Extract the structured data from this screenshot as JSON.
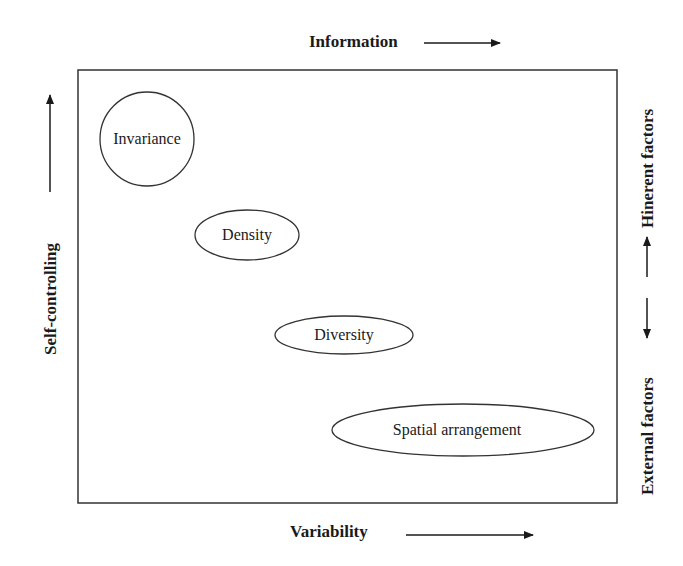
{
  "axes": {
    "top": {
      "label": "Information",
      "arrow": "right"
    },
    "bottom": {
      "label": "Variability",
      "arrow": "right"
    },
    "left": {
      "label": "Self-controlling",
      "arrow": "up"
    },
    "right": {
      "label_top": "Hinerent factors",
      "label_bottom": "External factors",
      "arrows": [
        "up",
        "down"
      ]
    }
  },
  "nodes": [
    {
      "label": "Invariance",
      "shape": "circle"
    },
    {
      "label": "Density",
      "shape": "ellipse"
    },
    {
      "label": "Diversity",
      "shape": "ellipse"
    },
    {
      "label": "Spatial arrangement",
      "shape": "ellipse"
    }
  ],
  "colors": {
    "stroke": "#333333",
    "text": "#1a1a1a",
    "background": "#ffffff"
  }
}
